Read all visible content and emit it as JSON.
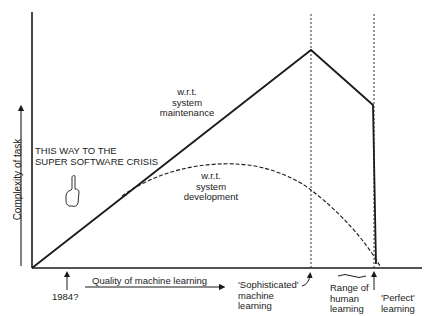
{
  "diagram": {
    "y_axis_label": "Complexity of task",
    "x_axis_label": "Quality of machine learning",
    "curves": {
      "maintenance": {
        "label_line1": "w.r.t.",
        "label_line2": "system",
        "label_line3": "maintenance",
        "style": "solid"
      },
      "development": {
        "label_line1": "w.r.t.",
        "label_line2": "system",
        "label_line3": "development",
        "style": "dashed"
      }
    },
    "annotation": {
      "line1": "THIS WAY TO THE",
      "line2": "SUPER SOFTWARE CRISIS",
      "icon": "pointing-hand-icon"
    },
    "markers": [
      {
        "id": "1984",
        "label": "1984?"
      },
      {
        "id": "sophisticated",
        "line1": "'Sophisticated'",
        "line2": "machine",
        "line3": "learning"
      },
      {
        "id": "human",
        "line1": "Range of",
        "line2": "human",
        "line3": "learning"
      },
      {
        "id": "perfect",
        "line1": "'Perfect'",
        "line2": "learning"
      }
    ],
    "colors": {
      "ink": "#1a1a1a",
      "background": "#ffffff"
    }
  }
}
